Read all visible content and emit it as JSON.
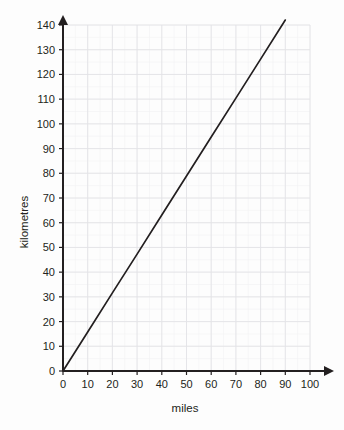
{
  "chart_data": {
    "type": "line",
    "title": "",
    "xlabel": "miles",
    "ylabel": "kilometres",
    "xlim": [
      0,
      100
    ],
    "ylim": [
      0,
      140
    ],
    "x_ticks": [
      0,
      10,
      20,
      30,
      40,
      50,
      60,
      70,
      80,
      90,
      100
    ],
    "y_ticks": [
      0,
      10,
      20,
      30,
      40,
      50,
      60,
      70,
      80,
      90,
      100,
      110,
      120,
      130,
      140
    ],
    "x_tick_labels": [
      "0",
      "10",
      "20",
      "30",
      "40",
      "50",
      "60",
      "70",
      "80",
      "90",
      "100"
    ],
    "y_tick_labels": [
      "0",
      "10",
      "20",
      "30",
      "40",
      "50",
      "60",
      "70",
      "80",
      "90",
      "100",
      "110",
      "120",
      "130",
      "140"
    ],
    "grid": true,
    "minor_grid": true,
    "minor_grid_divisions": 2,
    "legend": "none",
    "series": [
      {
        "name": "miles to kilometres conversion",
        "x": [
          0,
          90
        ],
        "values": [
          0,
          142
        ],
        "slope_km_per_mile": 1.58,
        "points": [
          {
            "x": 0,
            "y": 0
          },
          {
            "x": 10,
            "y": 15.8
          },
          {
            "x": 20,
            "y": 31.6
          },
          {
            "x": 30,
            "y": 47.3
          },
          {
            "x": 40,
            "y": 63.1
          },
          {
            "x": 50,
            "y": 78.9
          },
          {
            "x": 60,
            "y": 94.7
          },
          {
            "x": 70,
            "y": 110.4
          },
          {
            "x": 80,
            "y": 126.2
          },
          {
            "x": 90,
            "y": 142.0
          }
        ]
      }
    ],
    "colors": {
      "line": "#231f20",
      "axis": "#231f20",
      "grid_major": "#e3e3e6",
      "grid_minor": "#f2f2f4",
      "background": "#fdfdfd",
      "text": "#231f20"
    },
    "axis_arrows": {
      "x": true,
      "y": true
    }
  }
}
